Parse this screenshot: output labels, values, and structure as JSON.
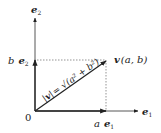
{
  "diagram": {
    "type": "vector-decomposition",
    "axes": {
      "x_label_base": "e",
      "x_label_sub": "1",
      "y_label_base": "e",
      "y_label_sub": "2",
      "origin_label": "0"
    },
    "components": {
      "x_coef": "a",
      "x_base": "e",
      "x_sub": "1",
      "y_coef": "b",
      "y_base": "e",
      "y_sub": "2"
    },
    "vector": {
      "name": "v",
      "point_label": "(a, b)",
      "magnitude_label": "|v| = √(a² + b²)",
      "magnitude_lhs_bar": "|",
      "magnitude_lhs_v": "v",
      "magnitude_rhs": "= √(a² + b²)"
    },
    "colors": {
      "line": "#333333",
      "dashed": "#555555",
      "text": "#222222"
    }
  }
}
